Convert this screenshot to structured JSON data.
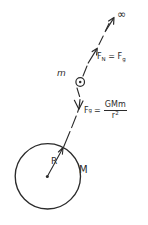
{
  "diagram": {
    "background_color": "#ffffff",
    "ink_color": "#2b2b2b",
    "labels": {
      "infinity": "∞",
      "small_mass": "m",
      "large_mass": "M",
      "radius": "R"
    },
    "equations": {
      "normal_force": {
        "lhs_symbol": "F",
        "lhs_subscript": "N",
        "relation": "=",
        "rhs_symbol": "F",
        "rhs_subscript": "g"
      },
      "gravity_law": {
        "lhs_symbol": "F",
        "lhs_subscript": "g",
        "relation": "=",
        "numerator": "GMm",
        "denominator_base": "r",
        "denominator_exponent": "2"
      }
    },
    "elements": {
      "planet_circle": "large circle representing mass M",
      "center_dot": "dot at circle center",
      "radius_arrow": "arrow from center to circle edge labeled R",
      "trajectory_line": "dashed line from circle surface to infinity",
      "up_arrow": "arrowhead pointing away from planet",
      "down_arrow": "arrowhead pointing toward planet",
      "mass_marker": "small circled dot on the line representing mass m",
      "infinity_arrow": "arrow pointing to infinity"
    }
  }
}
